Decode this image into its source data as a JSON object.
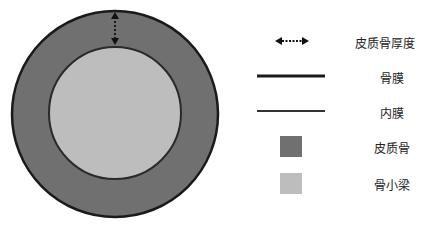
{
  "diagram": {
    "type": "bone-cross-section",
    "colors": {
      "cortical_bone": "#707070",
      "trabecular_bone": "#bdbdbd",
      "periosteum": "#1a1a1a",
      "endosteum": "#333333",
      "background": "#ffffff"
    }
  },
  "legend": {
    "items": [
      {
        "label": "皮质骨厚度",
        "icon": "double-arrow-dotted"
      },
      {
        "label": "骨膜",
        "icon": "thick-line"
      },
      {
        "label": "内膜",
        "icon": "thin-line"
      },
      {
        "label": "皮质骨",
        "icon": "dark-gray-square"
      },
      {
        "label": "骨小梁",
        "icon": "light-gray-square"
      }
    ]
  }
}
